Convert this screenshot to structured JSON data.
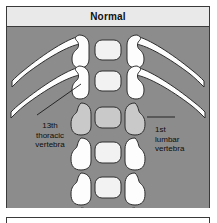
{
  "figure": {
    "title": "Normal",
    "type": "anatomical-illustration",
    "colors": {
      "background": "#8c8c8c",
      "header_band": "#e9e9e9",
      "bone_white": "#fdfdfd",
      "bone_highlight_gray": "#c9c9c9",
      "outline": "#2e2e2e",
      "border": "#3a3a3a",
      "text": "#0d0d0d"
    },
    "annotations": [
      {
        "id": "left-label",
        "lines": [
          "13th",
          "thoracic",
          "vertebra"
        ],
        "align": "center",
        "points_to": "second-vertebral-level-left-pedicle"
      },
      {
        "id": "right-label",
        "lines": [
          "1st",
          "lumbar",
          "vertebra"
        ],
        "align": "left",
        "points_to": "third-vertebral-level-right-pedicle"
      }
    ],
    "vertebral_levels": [
      {
        "index": 1,
        "has_ribs": true,
        "shade": "white"
      },
      {
        "index": 2,
        "has_ribs": true,
        "shade": "white"
      },
      {
        "index": 3,
        "has_ribs": false,
        "shade": "gray"
      },
      {
        "index": 4,
        "has_ribs": false,
        "shade": "white"
      },
      {
        "index": 5,
        "has_ribs": false,
        "shade": "white"
      },
      {
        "index": 6,
        "has_ribs": false,
        "shade": "white"
      }
    ],
    "rib_pairs": 2
  }
}
